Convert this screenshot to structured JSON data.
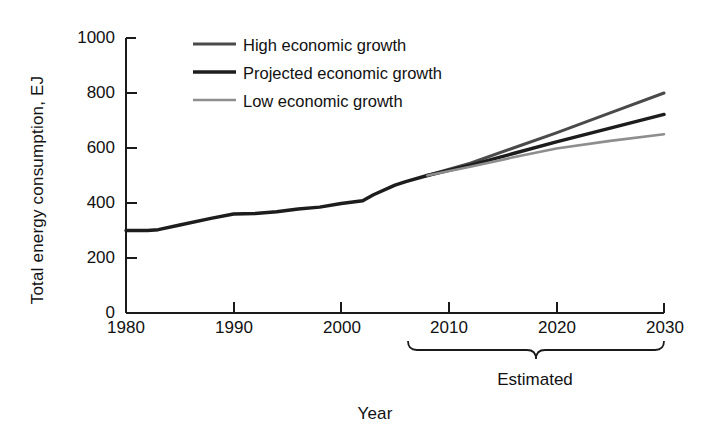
{
  "chart_data": {
    "type": "line",
    "title": "",
    "xlabel": "Year",
    "ylabel": "Total energy consumption, EJ",
    "xlim": [
      1980,
      2030
    ],
    "ylim": [
      0,
      1000
    ],
    "xticks": [
      1980,
      1990,
      2000,
      2010,
      2020,
      2030
    ],
    "yticks": [
      0,
      200,
      400,
      600,
      800,
      1000
    ],
    "grid": false,
    "legend_position": "top-left-inside",
    "annotations": [
      {
        "text": "Estimated",
        "x_range": [
          2008,
          2030
        ],
        "type": "brace-below-axis"
      }
    ],
    "historical": {
      "name": "Historical",
      "x": [
        1980,
        1982,
        1983,
        1985,
        1988,
        1990,
        1992,
        1994,
        1996,
        1998,
        2000,
        2002,
        2003,
        2005,
        2006,
        2008
      ],
      "values": [
        300,
        300,
        303,
        320,
        345,
        360,
        362,
        368,
        378,
        385,
        398,
        408,
        430,
        465,
        478,
        500
      ]
    },
    "series": [
      {
        "name": "High economic growth",
        "color": "#4a4a4a",
        "linewidth": 3.0,
        "x": [
          2008,
          2012,
          2016,
          2020,
          2025,
          2030
        ],
        "values": [
          500,
          545,
          600,
          655,
          728,
          800
        ]
      },
      {
        "name": "Projected economic growth",
        "color": "#1d1d1d",
        "linewidth": 3.4,
        "x": [
          2008,
          2012,
          2016,
          2020,
          2025,
          2030
        ],
        "values": [
          500,
          538,
          580,
          622,
          672,
          722
        ]
      },
      {
        "name": "Low economic growth",
        "color": "#8e8e8e",
        "linewidth": 2.6,
        "x": [
          2008,
          2012,
          2016,
          2020,
          2025,
          2030
        ],
        "values": [
          500,
          532,
          566,
          598,
          626,
          650
        ]
      }
    ]
  },
  "legend": {
    "items": [
      {
        "label": "High economic growth",
        "color": "#4a4a4a"
      },
      {
        "label": "Projected economic growth",
        "color": "#1d1d1d"
      },
      {
        "label": "Low economic growth",
        "color": "#8e8e8e"
      }
    ]
  },
  "axes": {
    "y_title": "Total energy consumption, EJ",
    "x_title": "Year",
    "y_tick_labels": [
      "1000",
      "800",
      "600",
      "400",
      "200",
      "0"
    ],
    "x_tick_labels": [
      "1980",
      "1990",
      "2000",
      "2010",
      "2020",
      "2030"
    ]
  },
  "annotation": {
    "estimated_label": "Estimated"
  },
  "colors": {
    "axis": "#1a1a1a",
    "background": "#ffffff",
    "high": "#4a4a4a",
    "projected": "#1d1d1d",
    "low": "#8e8e8e"
  }
}
